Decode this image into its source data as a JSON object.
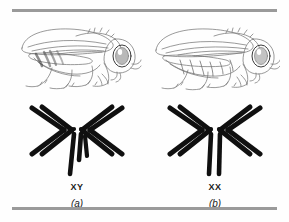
{
  "figure": {
    "background_color": "#fefefe",
    "rule_color": "#9a9a9a",
    "ink_color": "#111111",
    "sketch_color": "#6b6b6b"
  },
  "rules": {
    "top_label": "top-divider-rule",
    "bottom_label": "bottom-divider-rule"
  },
  "panels": [
    {
      "id": "a",
      "panel_label": "(a)",
      "sex_label": "XY",
      "organism": "Drosophila melanogaster male",
      "fly_icon": "fly-male-illustration",
      "karyotype_icon": "karyotype-xy",
      "chromosomes": {
        "autosome_pairs": 3,
        "chevrons_left": 2,
        "chevrons_right": 2,
        "dot_chromosomes": 2,
        "sex_chromosomes": [
          "X",
          "Y"
        ],
        "x_shape": "straight-rod",
        "y_shape": "hooked-rod"
      }
    },
    {
      "id": "b",
      "panel_label": "(b)",
      "sex_label": "XX",
      "organism": "Drosophila melanogaster female",
      "fly_icon": "fly-female-illustration",
      "karyotype_icon": "karyotype-xx",
      "chromosomes": {
        "autosome_pairs": 3,
        "chevrons_left": 2,
        "chevrons_right": 2,
        "dot_chromosomes": 2,
        "sex_chromosomes": [
          "X",
          "X"
        ],
        "x_shape": "straight-rod",
        "y_shape": "none"
      }
    }
  ]
}
